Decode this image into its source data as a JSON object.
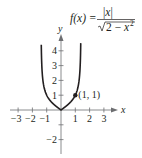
{
  "chart_data": {
    "type": "line",
    "function": {
      "name": "f(x)",
      "lhs": "f(x) =",
      "numerator": "|x|",
      "denominator_root": "2 − x",
      "denominator_exp": "2",
      "domain": [
        -1.414,
        1.414
      ]
    },
    "xlabel": "x",
    "ylabel": "y",
    "xlim": [
      -3.5,
      3.5
    ],
    "ylim": [
      -2.8,
      4.9
    ],
    "x_ticks": [
      -3,
      -2,
      -1,
      1,
      2,
      3
    ],
    "x_tick_labels": [
      "−3",
      "−2",
      "−1",
      "1",
      "2",
      "3"
    ],
    "y_ticks": [
      -2,
      -1,
      1,
      2,
      3,
      4
    ],
    "y_tick_labels": [
      "−2",
      "",
      "1",
      "2",
      "3",
      "4"
    ],
    "series": [
      {
        "name": "f(x)",
        "x": [
          -1.38,
          -1.35,
          -1.3,
          -1.25,
          -1.2,
          -1.1,
          -1.0,
          -0.8,
          -0.6,
          -0.4,
          -0.2,
          0,
          0.2,
          0.4,
          0.6,
          0.8,
          1.0,
          1.1,
          1.2,
          1.25,
          1.3,
          1.35,
          1.38
        ],
        "values": [
          4.5,
          3.2,
          2.32,
          1.89,
          1.61,
          1.24,
          1.0,
          0.7,
          0.47,
          0.3,
          0.14,
          0,
          0.14,
          0.3,
          0.47,
          0.7,
          1.0,
          1.24,
          1.61,
          1.89,
          2.32,
          3.2,
          4.5
        ]
      }
    ],
    "annotations": [
      {
        "point": [
          1,
          1
        ],
        "label": "(1, 1)"
      }
    ],
    "grid": false
  },
  "colors": {
    "curve": "#231f20",
    "axis": "#6d6e71",
    "text": "#231f20"
  }
}
